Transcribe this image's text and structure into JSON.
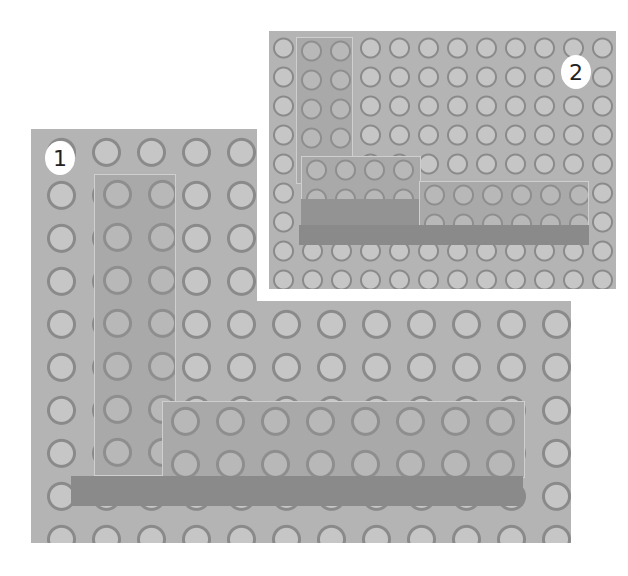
{
  "figure": {
    "photos": [
      {
        "label": "1",
        "content": "Close-up: 2x8 vertical brick and 2x8 horizontal brick forming an L on baseplate"
      },
      {
        "label": "2",
        "content": "Wider view: L-shaped brick assembly on baseplate"
      }
    ]
  }
}
